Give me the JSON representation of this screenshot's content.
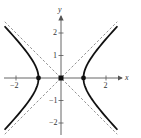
{
  "chart_data": {
    "type": "line",
    "title": "",
    "xlabel": "x",
    "ylabel": "y",
    "xlim": [
      -2.6,
      2.6
    ],
    "ylim": [
      -2.5,
      2.6
    ],
    "grid": false,
    "legend": null,
    "x_ticks": [
      -2,
      2
    ],
    "x_tick_labels": [
      "−2",
      "2"
    ],
    "y_ticks": [
      -2,
      -1,
      1,
      2
    ],
    "y_tick_labels": [
      "−2",
      "−1",
      "1",
      "2"
    ],
    "series": [
      {
        "name": "hyperbola x^2 - y^2 = 1",
        "style": "solid",
        "kind": "hyperbola",
        "a": 1,
        "b": 1,
        "y_extent": 2.3
      },
      {
        "name": "asymptote y = x",
        "style": "dashed",
        "slope": 1,
        "x_range": [
          -2.5,
          2.5
        ]
      },
      {
        "name": "asymptote y = -x",
        "style": "dashed",
        "slope": -1,
        "x_range": [
          -2.5,
          2.5
        ]
      }
    ],
    "points": [
      {
        "label": "vertex",
        "x": -1,
        "y": 0,
        "marker": "dot"
      },
      {
        "label": "vertex",
        "x": 1,
        "y": 0,
        "marker": "dot"
      },
      {
        "label": "center",
        "x": 0,
        "y": 0,
        "marker": "square"
      }
    ]
  },
  "axes": {
    "x_label": "x",
    "y_label": "y",
    "origin_px": [
      61,
      78
    ],
    "unit_px": 22.5,
    "colors": {
      "curve": "#111111",
      "asymptote": "#777777",
      "axis": "#555555"
    }
  }
}
